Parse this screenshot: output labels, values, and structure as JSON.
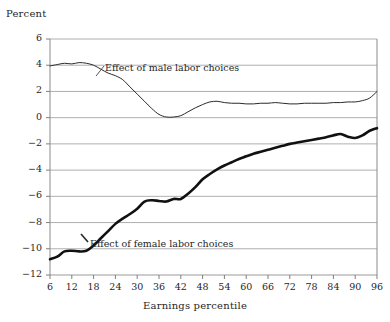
{
  "chart": {
    "ylabel": "Percent",
    "xlabel": "Earnings percentile"
  },
  "labels": {
    "male": "Effect of male labor choices",
    "female": "Effect of female labor choices"
  },
  "chart_data": {
    "type": "line",
    "title": "",
    "subtitle": "",
    "xlabel": "Earnings percentile",
    "ylabel": "Percent",
    "xlim": [
      6,
      96
    ],
    "ylim": [
      -12,
      6
    ],
    "ytick_labels": [
      "6",
      "4",
      "2",
      "0",
      "-2",
      "-4",
      "-6",
      "-8",
      "-10",
      "-12"
    ],
    "yticks": [
      6,
      4,
      2,
      0,
      -2,
      -4,
      -6,
      -8,
      -10,
      -12
    ],
    "xticks": [
      6,
      12,
      18,
      24,
      30,
      36,
      42,
      48,
      54,
      60,
      66,
      72,
      78,
      84,
      90,
      96
    ],
    "grid": "horizontal",
    "legend_position": "inline-annotation",
    "x": [
      6,
      8,
      10,
      12,
      14,
      16,
      18,
      20,
      22,
      24,
      26,
      28,
      30,
      32,
      34,
      36,
      38,
      40,
      42,
      44,
      46,
      48,
      50,
      52,
      54,
      56,
      58,
      60,
      62,
      64,
      66,
      68,
      70,
      72,
      74,
      76,
      78,
      80,
      82,
      84,
      86,
      88,
      90,
      92,
      94,
      96
    ],
    "series": [
      {
        "name": "Effect of male labor choices",
        "color": "#2b2b2b",
        "line_width": 1,
        "values": [
          3.95,
          4.05,
          4.15,
          4.1,
          4.2,
          4.15,
          4.0,
          3.7,
          3.4,
          3.2,
          2.9,
          2.35,
          1.8,
          1.25,
          0.7,
          0.25,
          0.05,
          0.05,
          0.15,
          0.45,
          0.75,
          1.0,
          1.2,
          1.25,
          1.15,
          1.1,
          1.1,
          1.05,
          1.05,
          1.1,
          1.1,
          1.15,
          1.1,
          1.05,
          1.05,
          1.1,
          1.1,
          1.1,
          1.1,
          1.15,
          1.15,
          1.2,
          1.2,
          1.3,
          1.5,
          2.0
        ]
      },
      {
        "name": "Effect of female labor choices",
        "color": "#111111",
        "line_width": 2.6,
        "values": [
          -10.8,
          -10.6,
          -10.2,
          -10.15,
          -10.2,
          -10.15,
          -9.75,
          -9.2,
          -8.65,
          -8.1,
          -7.7,
          -7.35,
          -6.95,
          -6.4,
          -6.3,
          -6.35,
          -6.4,
          -6.2,
          -6.2,
          -5.8,
          -5.3,
          -4.7,
          -4.3,
          -3.95,
          -3.65,
          -3.4,
          -3.15,
          -2.95,
          -2.75,
          -2.6,
          -2.45,
          -2.3,
          -2.15,
          -2.0,
          -1.9,
          -1.8,
          -1.7,
          -1.6,
          -1.5,
          -1.35,
          -1.25,
          -1.45,
          -1.55,
          -1.35,
          -1.0,
          -0.8
        ]
      }
    ]
  }
}
